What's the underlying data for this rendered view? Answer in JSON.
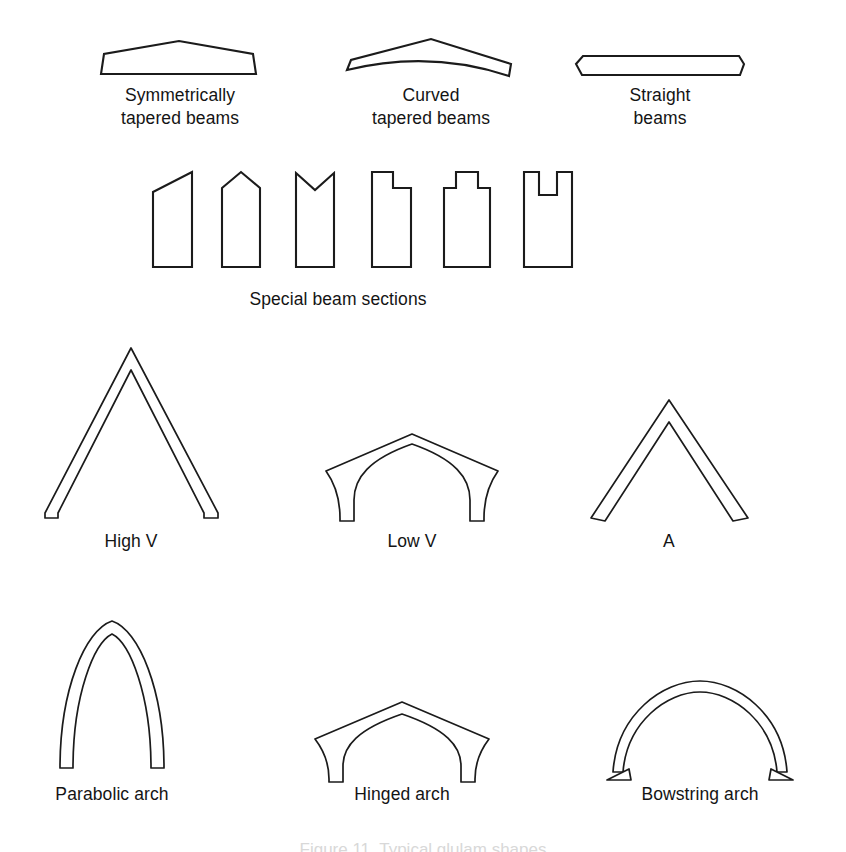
{
  "figure": {
    "background_color": "#ffffff",
    "line_color": "#1b1b1b",
    "text_color": "#141414",
    "partial_caption": "Figure 11. Typical glulam shapes",
    "rows": [
      {
        "row_name": "tapered-and-straight-beams",
        "items": [
          {
            "label": "Symmetrically\ntapered beams",
            "shape": "symmetrically-tapered-beam"
          },
          {
            "label": "Curved\ntapered beams",
            "shape": "curved-tapered-beam"
          },
          {
            "label": "Straight\nbeams",
            "shape": "straight-beam"
          }
        ]
      },
      {
        "row_name": "special-beam-sections",
        "label": "Special beam sections",
        "items": [
          {
            "shape": "section-single-slope"
          },
          {
            "shape": "section-gabled-peak"
          },
          {
            "shape": "section-v-notch"
          },
          {
            "shape": "section-stepped-shoulder"
          },
          {
            "shape": "section-center-tenon"
          },
          {
            "shape": "section-center-slot"
          }
        ]
      },
      {
        "row_name": "v-and-a-frames",
        "items": [
          {
            "label": "High V",
            "shape": "high-v-frame"
          },
          {
            "label": "Low V",
            "shape": "low-v-frame"
          },
          {
            "label": "A",
            "shape": "a-frame"
          }
        ]
      },
      {
        "row_name": "arches",
        "items": [
          {
            "label": "Parabolic arch",
            "shape": "parabolic-arch"
          },
          {
            "label": "Hinged arch",
            "shape": "hinged-arch"
          },
          {
            "label": "Bowstring arch",
            "shape": "bowstring-arch"
          }
        ]
      }
    ]
  },
  "captions": {
    "symmetrically_tapered_beams": "Symmetrically\ntapered beams",
    "curved_tapered_beams": "Curved\ntapered beams",
    "straight_beams": "Straight\nbeams",
    "special_beam_sections": "Special beam sections",
    "high_v": "High V",
    "low_v": "Low V",
    "a_frame": "A",
    "parabolic_arch": "Parabolic arch",
    "hinged_arch": "Hinged arch",
    "bowstring_arch": "Bowstring arch",
    "figure_number": "Figure 11. Typical glulam shapes"
  }
}
